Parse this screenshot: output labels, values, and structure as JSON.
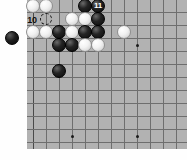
{
  "diagram": {
    "kind": "go-board-diagram",
    "board": {
      "background_color": "#b2b2b2",
      "line_color": "#6e6e6e",
      "edge_color": "#4a4a4a",
      "left": 27,
      "top": -20,
      "width": 160,
      "height": 169,
      "cell": 13,
      "cols": 12,
      "rows": 13,
      "origin_x": 33,
      "origin_y": -14
    },
    "star_points": [
      {
        "cx": 137,
        "cy": 45
      },
      {
        "cx": 72,
        "cy": 136
      },
      {
        "cx": 137,
        "cy": 136
      }
    ],
    "stone_radius": 7,
    "stones": [
      {
        "color": "white",
        "cx": 33,
        "cy": 6,
        "label": ""
      },
      {
        "color": "white",
        "cx": 46,
        "cy": 6,
        "label": ""
      },
      {
        "color": "black",
        "cx": 85,
        "cy": 6,
        "label": ""
      },
      {
        "color": "black",
        "cx": 98,
        "cy": 6,
        "label": "11"
      },
      {
        "color": "white",
        "cx": 72,
        "cy": 19,
        "label": ""
      },
      {
        "color": "white",
        "cx": 85,
        "cy": 19,
        "label": ""
      },
      {
        "color": "black",
        "cx": 98,
        "cy": 19,
        "label": ""
      },
      {
        "color": "white",
        "cx": 33,
        "cy": 32,
        "label": ""
      },
      {
        "color": "white",
        "cx": 46,
        "cy": 32,
        "label": ""
      },
      {
        "color": "black",
        "cx": 59,
        "cy": 32,
        "label": ""
      },
      {
        "color": "white",
        "cx": 72,
        "cy": 32,
        "label": ""
      },
      {
        "color": "black",
        "cx": 85,
        "cy": 32,
        "label": ""
      },
      {
        "color": "black",
        "cx": 98,
        "cy": 32,
        "label": ""
      },
      {
        "color": "white",
        "cx": 124,
        "cy": 32,
        "label": ""
      },
      {
        "color": "black",
        "cx": 59,
        "cy": 45,
        "label": ""
      },
      {
        "color": "black",
        "cx": 72,
        "cy": 45,
        "label": ""
      },
      {
        "color": "white",
        "cx": 85,
        "cy": 45,
        "label": ""
      },
      {
        "color": "white",
        "cx": 98,
        "cy": 45,
        "label": ""
      },
      {
        "color": "black",
        "cx": 59,
        "cy": 71,
        "label": ""
      }
    ],
    "offboard_stones": [
      {
        "color": "black",
        "cx": 12,
        "cy": 38,
        "r": 7
      }
    ],
    "ghost_markers": [
      {
        "cx": 46,
        "cy": 19,
        "r": 6,
        "style": "dashed"
      }
    ],
    "text_markers": [
      {
        "text": "10",
        "cx": 32,
        "cy": 20,
        "on": "plain",
        "size": 9
      }
    ],
    "label_on_stone_size": 8
  }
}
